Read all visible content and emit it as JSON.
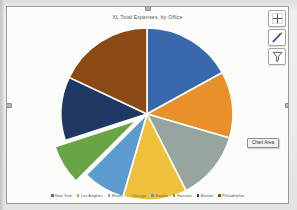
{
  "app": {
    "object_type": "excel-chart-object",
    "chart_area_tooltip": "Chart Area"
  },
  "chart_buttons": [
    {
      "name": "chart-elements-button",
      "icon": "plus-icon",
      "label": "Chart Elements"
    },
    {
      "name": "chart-styles-button",
      "icon": "brush-icon",
      "label": "Chart Styles"
    },
    {
      "name": "chart-filters-button",
      "icon": "funnel-icon",
      "label": "Chart Filters"
    }
  ],
  "background_text": {
    "line1": "—————",
    "line2": "——"
  },
  "chart_data": {
    "type": "pie",
    "title": "XL Total Expenses, by Office",
    "xlabel": "",
    "ylabel": "",
    "legend_position": "bottom",
    "grid": false,
    "explode_index": 5,
    "start_angle_deg": 0,
    "categories": [
      "New York",
      "Los Angeles",
      "Miami",
      "Chicago",
      "Seattle",
      "Houston",
      "Boston",
      "Philadelphia"
    ],
    "values": [
      17.0,
      12.5,
      13.0,
      12.0,
      8.0,
      7.5,
      12.0,
      18.0
    ],
    "colors": [
      "#3a68ad",
      "#e8912a",
      "#97a5a0",
      "#f0c13c",
      "#5b9bd0",
      "#6aa544",
      "#1f3864",
      "#8c4a13"
    ]
  }
}
